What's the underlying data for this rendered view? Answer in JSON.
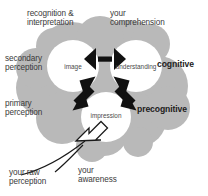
{
  "diagram": {
    "colors": {
      "cloud_fill": "#b9b9b9",
      "node_fill": "#ffffff",
      "arrow": "#111111",
      "text": "#3a3a3a",
      "bold_text": "#1c1c1c",
      "background": "#ffffff"
    },
    "nodes": [
      {
        "id": "image",
        "label": "image"
      },
      {
        "id": "understanding",
        "label": "understanding"
      },
      {
        "id": "impression",
        "label": "impression"
      }
    ],
    "annotations": {
      "top_left": "recognition &\ninterpretation",
      "top_right": "your\ncomprehension",
      "left_upper": "secondary\nperception",
      "left_lower": "primary\nperception",
      "right_upper": "cognitive",
      "right_lower": "precognitive",
      "bottom_left": "your raw\nperception",
      "bottom_center": "your\nawareness"
    },
    "arrows": [
      {
        "id": "image-understanding",
        "type": "double-headed",
        "from": "image",
        "to": "understanding"
      },
      {
        "id": "image-impression",
        "type": "double-headed",
        "from": "image",
        "to": "impression"
      },
      {
        "id": "understanding-impression",
        "type": "double-headed",
        "from": "understanding",
        "to": "impression"
      },
      {
        "id": "raw-perception-inflow",
        "type": "outline-block-arrow",
        "from": "your raw perception",
        "to": "impression"
      }
    ]
  }
}
